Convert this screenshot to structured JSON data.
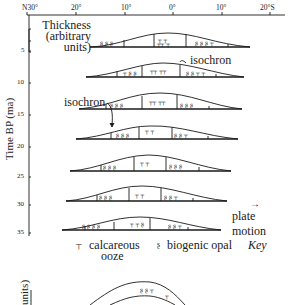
{
  "top_axis": {
    "latitudes": [
      {
        "label": "N30°",
        "x": 22
      },
      {
        "label": "20°",
        "x": 71
      },
      {
        "label": "10°",
        "x": 121
      },
      {
        "label": "0°",
        "x": 170
      },
      {
        "label": "10°",
        "x": 219
      },
      {
        "label": "20°S",
        "x": 262
      }
    ]
  },
  "y_axis": {
    "title": "Time BP (ma)",
    "ticks": [
      {
        "label": "5",
        "y": 48
      },
      {
        "label": "10",
        "y": 80
      },
      {
        "label": "15",
        "y": 112
      },
      {
        "label": "20",
        "y": 146
      },
      {
        "label": "25",
        "y": 174
      },
      {
        "label": "30",
        "y": 203
      },
      {
        "label": "35",
        "y": 230
      }
    ]
  },
  "thickness_legend": {
    "line1": "Thickness",
    "line2": "(arbitrary",
    "line3": "units)"
  },
  "annotations": {
    "isochron_upper": "isochron",
    "isochron_lower": "isochron",
    "plate_motion": "plate motion",
    "plate_motion_arrow": "→"
  },
  "key": {
    "calcareous_symbol": "┬",
    "calcareous_label_1": "calcareous",
    "calcareous_label_2": "ooze",
    "opal_symbol": "ʂ",
    "opal_label": "biogenic opal",
    "key_title": "Key"
  },
  "lower_panel": {
    "y_axis_title": "units)"
  },
  "colors": {
    "ink": "#1a1a1a",
    "background": "#ffffff"
  }
}
